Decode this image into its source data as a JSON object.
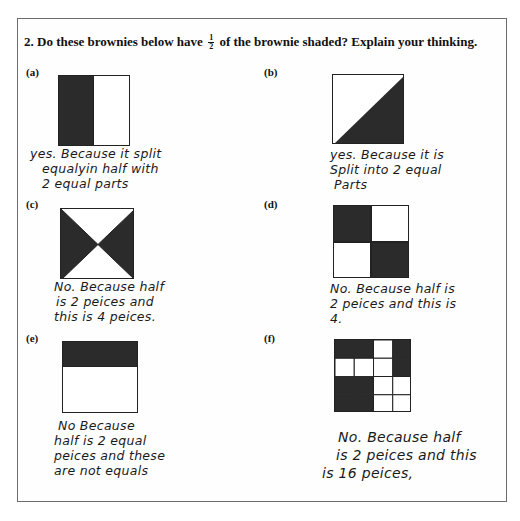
{
  "question": {
    "prefix": "2. Do these brownies below have",
    "fraction_numerator": "1",
    "fraction_denominator": "2",
    "suffix": "of the brownie shaded? Explain your thinking."
  },
  "items": [
    {
      "label": "(a)",
      "figure": "square split vertically in half, left half shaded",
      "answer_lines": [
        "yes. Because it split",
        "equalyin half with",
        "2 equal parts"
      ]
    },
    {
      "label": "(b)",
      "figure": "square split diagonally, lower-right triangle shaded",
      "answer_lines": [
        "yes. Because it is",
        "Split into 2 equal",
        "Parts"
      ]
    },
    {
      "label": "(c)",
      "figure": "square split by both diagonals, left and right triangles shaded",
      "answer_lines": [
        "No. Because half",
        "is 2 peices and",
        "this is 4 peices."
      ]
    },
    {
      "label": "(d)",
      "figure": "2x2 grid, top-left and bottom-right shaded",
      "answer_lines": [
        "No. Because half is",
        "2 peices and this is",
        "4."
      ]
    },
    {
      "label": "(e)",
      "figure": "square with top third band shaded",
      "answer_lines": [
        "No Because",
        "half is 2 equal",
        "peices and these",
        "are not equals"
      ]
    },
    {
      "label": "(f)",
      "figure": "4x4 grid with 7 cells shaded",
      "grid_shaded": [
        [
          1,
          1,
          0,
          1
        ],
        [
          0,
          0,
          0,
          1
        ],
        [
          1,
          1,
          0,
          0
        ],
        [
          1,
          1,
          0,
          0
        ]
      ],
      "answer_lines": [
        "No. Because half",
        "is 2 peices and this",
        "is 16 peices,"
      ]
    }
  ],
  "colors": {
    "shade": "#2b2b2b",
    "border": "#222222",
    "frame": "#6d6d6d"
  }
}
